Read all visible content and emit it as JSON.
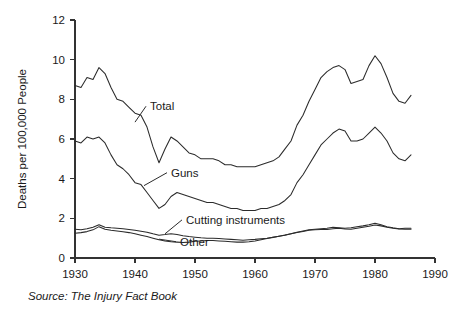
{
  "source_note": "Source: The Injury Fact Book",
  "chart_data": {
    "type": "line",
    "title": "",
    "xlabel": "",
    "ylabel": "Deaths per 100,000 People",
    "xlim": [
      1930,
      1990
    ],
    "ylim": [
      0,
      12
    ],
    "xticks": [
      1930,
      1940,
      1950,
      1960,
      1970,
      1980,
      1990
    ],
    "yticks": [
      0,
      2,
      4,
      6,
      8,
      10,
      12
    ],
    "grid": false,
    "legend_position": "inline-annotations",
    "annotations": [
      {
        "label": "Total",
        "x": 1942.5,
        "y": 7.45,
        "anchor_x": 1940.0,
        "anchor_y": 6.85
      },
      {
        "label": "Guns",
        "x": 1946.0,
        "y": 4.1,
        "anchor_x": 1941.5,
        "anchor_y": 3.65
      },
      {
        "label": "Cutting instruments",
        "x": 1948.5,
        "y": 1.72,
        "anchor_x": 1945.0,
        "anchor_y": 1.22
      },
      {
        "label": "Other",
        "x": 1947.5,
        "y": 0.62,
        "anchor_x": 1944.0,
        "anchor_y": 0.95
      }
    ],
    "x": [
      1930,
      1931,
      1932,
      1933,
      1934,
      1935,
      1936,
      1937,
      1938,
      1939,
      1940,
      1941,
      1942,
      1943,
      1944,
      1945,
      1946,
      1947,
      1948,
      1949,
      1950,
      1951,
      1952,
      1953,
      1954,
      1955,
      1956,
      1957,
      1958,
      1959,
      1960,
      1961,
      1962,
      1963,
      1964,
      1965,
      1966,
      1967,
      1968,
      1969,
      1970,
      1971,
      1972,
      1973,
      1974,
      1975,
      1976,
      1977,
      1978,
      1979,
      1980,
      1981,
      1982,
      1983,
      1984,
      1985,
      1986
    ],
    "series": [
      {
        "name": "Total",
        "values": [
          8.7,
          8.6,
          9.1,
          9.0,
          9.6,
          9.3,
          8.6,
          8.0,
          7.9,
          7.6,
          7.3,
          7.2,
          6.6,
          5.6,
          4.8,
          5.5,
          6.1,
          5.9,
          5.6,
          5.3,
          5.2,
          5.0,
          5.0,
          5.0,
          4.9,
          4.7,
          4.7,
          4.6,
          4.6,
          4.6,
          4.6,
          4.7,
          4.8,
          4.9,
          5.1,
          5.5,
          5.9,
          6.7,
          7.2,
          7.9,
          8.5,
          9.1,
          9.4,
          9.6,
          9.7,
          9.5,
          8.8,
          8.9,
          9.0,
          9.7,
          10.2,
          9.8,
          9.1,
          8.3,
          7.9,
          7.8,
          8.2
        ]
      },
      {
        "name": "Guns",
        "values": [
          5.9,
          5.8,
          6.1,
          6.0,
          6.1,
          5.8,
          5.2,
          4.7,
          4.5,
          4.2,
          3.8,
          3.7,
          3.3,
          2.9,
          2.5,
          2.7,
          3.1,
          3.3,
          3.2,
          3.1,
          3.0,
          2.9,
          2.8,
          2.8,
          2.7,
          2.6,
          2.5,
          2.5,
          2.4,
          2.4,
          2.4,
          2.5,
          2.5,
          2.6,
          2.7,
          2.9,
          3.2,
          3.8,
          4.2,
          4.7,
          5.2,
          5.7,
          6.0,
          6.3,
          6.5,
          6.4,
          5.9,
          5.9,
          6.0,
          6.3,
          6.6,
          6.3,
          5.9,
          5.3,
          5.0,
          4.9,
          5.2
        ]
      },
      {
        "name": "Cutting instruments",
        "values": [
          1.45,
          1.42,
          1.48,
          1.55,
          1.68,
          1.55,
          1.52,
          1.5,
          1.47,
          1.44,
          1.4,
          1.35,
          1.3,
          1.22,
          1.15,
          1.18,
          1.22,
          1.18,
          1.12,
          1.08,
          1.05,
          1.02,
          1.0,
          1.0,
          0.98,
          0.96,
          0.94,
          0.92,
          0.9,
          0.92,
          0.94,
          0.97,
          1.0,
          1.05,
          1.1,
          1.15,
          1.22,
          1.3,
          1.36,
          1.42,
          1.45,
          1.48,
          1.5,
          1.55,
          1.53,
          1.5,
          1.52,
          1.58,
          1.62,
          1.68,
          1.75,
          1.68,
          1.58,
          1.52,
          1.48,
          1.5,
          1.5
        ]
      },
      {
        "name": "Other",
        "values": [
          1.25,
          1.28,
          1.33,
          1.42,
          1.58,
          1.45,
          1.4,
          1.36,
          1.32,
          1.28,
          1.22,
          1.15,
          1.08,
          1.0,
          0.92,
          0.86,
          0.82,
          0.8,
          0.78,
          0.8,
          0.84,
          0.86,
          0.88,
          0.88,
          0.86,
          0.84,
          0.82,
          0.8,
          0.8,
          0.82,
          0.86,
          0.92,
          0.98,
          1.04,
          1.1,
          1.16,
          1.22,
          1.28,
          1.34,
          1.4,
          1.42,
          1.44,
          1.44,
          1.48,
          1.5,
          1.46,
          1.45,
          1.5,
          1.55,
          1.6,
          1.66,
          1.62,
          1.55,
          1.5,
          1.46,
          1.45,
          1.45
        ]
      }
    ]
  }
}
